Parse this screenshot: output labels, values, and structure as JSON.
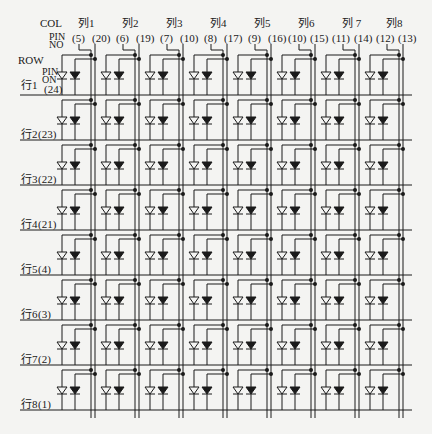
{
  "header": {
    "col_label": "COL",
    "pin_no_label_line1": "PIN",
    "pin_no_label_line2": "NO",
    "row_label": "ROW",
    "pin_on_label_line1": "PIN",
    "pin_on_label_line2": "ON"
  },
  "columns": [
    {
      "label": "列1",
      "pin_a": "(5)",
      "pin_b": "(20)"
    },
    {
      "label": "列2",
      "pin_a": "(6)",
      "pin_b": "(19)"
    },
    {
      "label": "列3",
      "pin_a": "(7)",
      "pin_b": "(10)"
    },
    {
      "label": "列4",
      "pin_a": "(8)",
      "pin_b": "(17)"
    },
    {
      "label": "列5",
      "pin_a": "(9)",
      "pin_b": "(16)"
    },
    {
      "label": "列6",
      "pin_a": "(10)",
      "pin_b": "(15)"
    },
    {
      "label": "列 7",
      "pin_a": "(11)",
      "pin_b": "(14)"
    },
    {
      "label": "列8",
      "pin_a": "(12)",
      "pin_b": "(13)"
    }
  ],
  "rows": [
    {
      "label": "行1",
      "pin": "(24)"
    },
    {
      "label": "行2",
      "pin": "(23)"
    },
    {
      "label": "行3",
      "pin": "(22)"
    },
    {
      "label": "行4",
      "pin": "(21)"
    },
    {
      "label": "行5",
      "pin": "(4)"
    },
    {
      "label": "行6",
      "pin": "(3)"
    },
    {
      "label": "行7",
      "pin": "(2)"
    },
    {
      "label": "行8",
      "pin": "(1)"
    }
  ],
  "colors": {
    "line": "#1a1a1a",
    "background": "#f4f4f2"
  }
}
